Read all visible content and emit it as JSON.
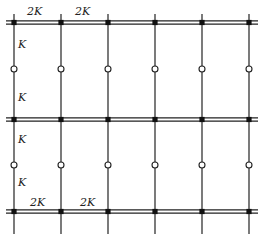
{
  "diagram": {
    "type": "multi-story frame with hinged columns",
    "columns_x": [
      14,
      61,
      108,
      155,
      202,
      249
    ],
    "beam_levels_y": [
      22.5,
      119.5,
      211.5
    ],
    "hinge_levels_y": [
      69,
      165
    ],
    "column_extent": [
      14,
      234
    ],
    "beam_extent": [
      6,
      258
    ],
    "colors": {
      "stroke": "#222222",
      "node": "#111111",
      "hinge_fill": "#ffffff"
    },
    "labels": {
      "top_beam_1": "2K",
      "top_beam_2": "2K",
      "upper_column_top": "K",
      "upper_column_bottom": "K",
      "lower_column_top": "K",
      "lower_column_bottom": "K",
      "bottom_beam_1": "2K",
      "bottom_beam_2": "2K"
    }
  }
}
